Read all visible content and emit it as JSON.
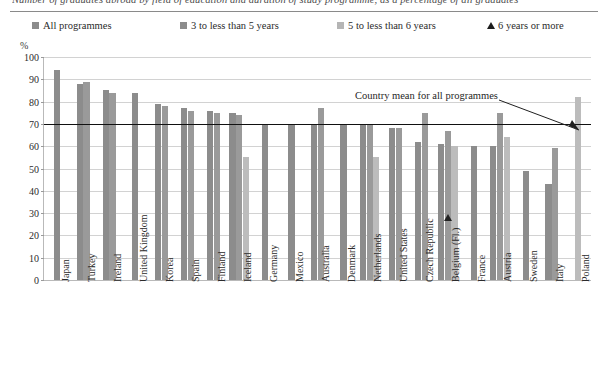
{
  "figure": {
    "title": "Number of graduates abroad by field of education and duration of study programme, as a percentage of all graduates",
    "unit_label": "%",
    "annotation": "Country mean for all programmes"
  },
  "legend": {
    "items": [
      {
        "label": "All programmes",
        "marker": "square",
        "color": "#8c8c8c"
      },
      {
        "label": "3 to less than 5 years",
        "marker": "square",
        "color": "#8c8c8c"
      },
      {
        "label": "5 to less than 6 years",
        "marker": "square",
        "color": "#b5b5b5"
      },
      {
        "label": "6 years or more",
        "marker": "triangle",
        "color": "#1c1c1c"
      }
    ]
  },
  "chart_data": {
    "type": "bar",
    "title": "Number of graduates abroad by field of education and duration of study programme, as a percentage of all graduates",
    "xlabel": "",
    "ylabel": "%",
    "ylim": [
      0,
      100
    ],
    "yticks": [
      0,
      10,
      20,
      30,
      40,
      50,
      60,
      70,
      80,
      90,
      100
    ],
    "grid": true,
    "legend_position": "top",
    "country_mean": 70,
    "categories": [
      "Japan",
      "Turkey",
      "Ireland",
      "United Kingdom",
      "Korea",
      "Spain",
      "Finland",
      "Iceland",
      "Germany",
      "Mexico",
      "Australia",
      "Denmark",
      "Netherlands",
      "United States",
      "Czech Republic",
      "Belgium (Fl.)",
      "France",
      "Austria",
      "Sweden",
      "Italy",
      "Poland"
    ],
    "series": [
      {
        "name": "All programmes",
        "color": "#8c8c8c",
        "values": [
          94,
          88,
          85,
          84,
          79,
          77,
          76,
          75,
          70,
          70,
          70,
          70,
          70,
          68,
          62,
          61,
          60,
          60,
          49,
          43,
          null
        ]
      },
      {
        "name": "3 to less than 5 years",
        "color": "#9a9a9a",
        "values": [
          null,
          89,
          84,
          null,
          78,
          76,
          75,
          74,
          null,
          null,
          77,
          null,
          70,
          68,
          75,
          67,
          null,
          75,
          null,
          59,
          null
        ]
      },
      {
        "name": "5 to less than 6 years",
        "color": "#bcbcbc",
        "values": [
          null,
          null,
          null,
          null,
          null,
          null,
          null,
          55,
          null,
          null,
          null,
          null,
          55,
          null,
          null,
          60,
          null,
          64,
          null,
          null,
          82
        ]
      }
    ],
    "markers": [
      {
        "name": "6 years or more",
        "category": "Belgium (Fl.)",
        "value": 28
      }
    ]
  }
}
